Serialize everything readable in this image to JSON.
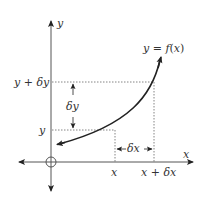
{
  "diagram": {
    "curve_label": {
      "lhs": "y",
      "eq": " = ",
      "func": "f",
      "open": "(",
      "arg": "x",
      "close": ")"
    },
    "axes": {
      "x_label": "x",
      "y_label": "y"
    },
    "y_markers": {
      "upper": {
        "var": "y",
        "plus": " + ",
        "delta": "δy"
      },
      "lower": "y"
    },
    "x_markers": {
      "left": "x",
      "right": {
        "var": "x",
        "plus": " + ",
        "delta": "δx"
      }
    },
    "increments": {
      "dy": "δy",
      "dx": "δx"
    },
    "colors": {
      "stroke": "#333333",
      "axis": "#555555",
      "dotted": "#555555"
    }
  }
}
